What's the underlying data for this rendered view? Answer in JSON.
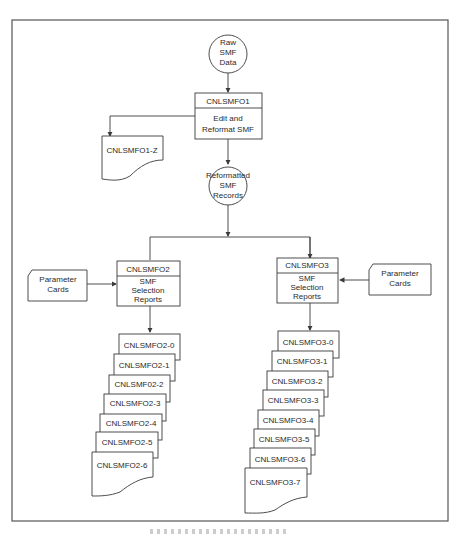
{
  "diagram": {
    "start": {
      "label_lines": [
        "Raw",
        "SMF",
        "Data"
      ]
    },
    "step1": {
      "program": "CNLSMFO1",
      "function_lines": [
        "Edit and",
        "Reformat SMF"
      ]
    },
    "step1_output": {
      "label": "CNLSMFO1-Z"
    },
    "intermediate": {
      "label_lines": [
        "Reformatted",
        "SMF",
        "Records"
      ]
    },
    "branch_left": {
      "program": "CNLSMFO2",
      "function_lines": [
        "SMF",
        "Selection",
        "Reports"
      ],
      "input": {
        "label_lines": [
          "Parameter",
          "Cards"
        ]
      },
      "reports": [
        "CNLSMFO2-0",
        "CNLSMFO2-1",
        "CNLSMF02-2",
        "CNLSMFO2-3",
        "CNLSMFO2-4",
        "CNLSMFO2-5",
        "CNLSMFO2-6"
      ]
    },
    "branch_right": {
      "program": "CNLSMFO3",
      "function_lines": [
        "SMF",
        "Selection",
        "Reports"
      ],
      "input": {
        "label_lines": [
          "Parameter",
          "Cards"
        ]
      },
      "reports": [
        "CNLSMFO3-0",
        "CNLSMFO3-1",
        "CNLSMFO3-2",
        "CNLSMFO3-3",
        "CNLSMFO3-4",
        "CNLSMFO3-5",
        "CNLSMFO3-6",
        "CNLSMFO3-7"
      ]
    }
  },
  "colors": {
    "line": "#3a3a3a",
    "frame": "#555555",
    "text": "#2a2a2a",
    "background": "#ffffff"
  }
}
